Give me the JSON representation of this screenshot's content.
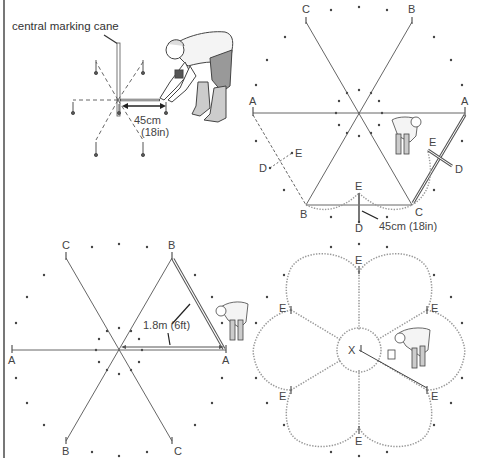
{
  "panels": {
    "step1": {
      "caption": "central marking cane",
      "measure_line1": "45cm",
      "measure_line2": "(18in)"
    },
    "step2": {
      "labels": {
        "top_left": "C",
        "top_right": "B",
        "left": "A",
        "right": "A",
        "bottom_left": "B",
        "bottom_right": "C",
        "e_bottom": "E",
        "d_bottom": "D",
        "e_left": "E",
        "d_left": "D",
        "e_right": "E",
        "d_right": "D"
      },
      "measure": "45cm (18in)"
    },
    "step3": {
      "labels": {
        "top_left": "C",
        "top_right": "B",
        "left": "A",
        "right": "A",
        "bottom_left": "B",
        "bottom_right": "C"
      },
      "measure": "1.8m (6ft)"
    },
    "step4": {
      "center_label": "X",
      "petal_points": [
        "E",
        "E",
        "E",
        "E",
        "E",
        "E"
      ]
    }
  },
  "colors": {
    "line": "#555555",
    "dotted": "#999999",
    "text": "#444444"
  }
}
